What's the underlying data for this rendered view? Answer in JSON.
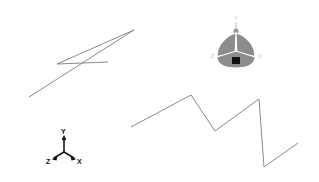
{
  "viewport": {
    "name": "3d-modeling-viewport",
    "width": 319,
    "height": 182,
    "background_color": "#ffffff",
    "sketch_stroke_color": "#8a8a8a",
    "sketch_stroke_width": 1
  },
  "sketches": [
    {
      "name": "upper-left-zigzag",
      "label": "Upper left zigzag polyline",
      "points": "29,97 134,30 57,64 108,62",
      "vertex_count": 4
    },
    {
      "name": "lower-right-zigzag",
      "label": "Lower right zigzag polyline",
      "points": "131,127 191,95 215,131 259,99 264,167 298,143",
      "vertex_count": 6
    }
  ],
  "view_gizmo": {
    "name": "view-orientation-gizmo",
    "accent_color": "#8c8c8c",
    "core_color": "#111111",
    "label_color": "#b9b9b9",
    "labels": {
      "y": "Y",
      "x": "X",
      "z": "Z"
    }
  },
  "axis_triad": {
    "name": "axis-triad-indicator",
    "color": "#111111",
    "labels": {
      "y": "Y",
      "x": "X",
      "z": "Z"
    }
  }
}
